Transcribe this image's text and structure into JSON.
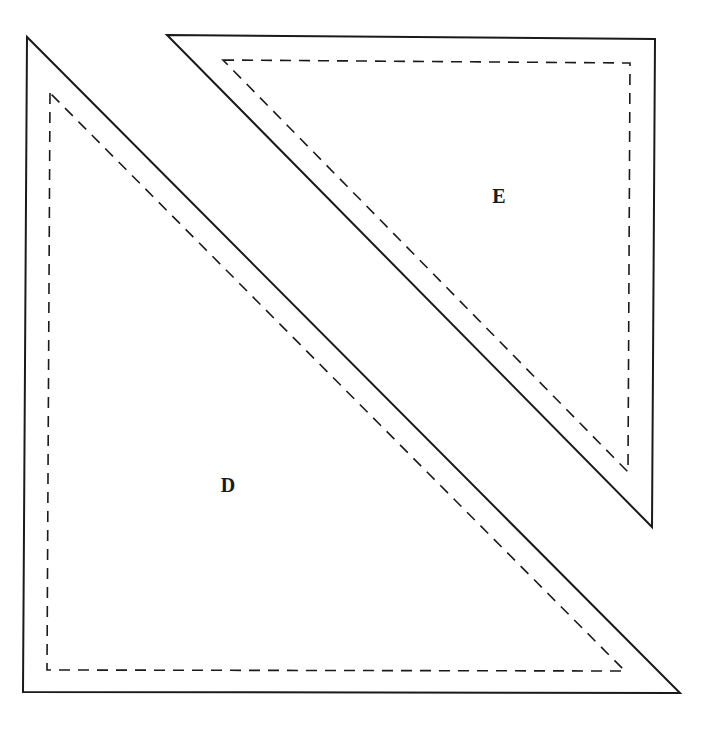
{
  "diagram": {
    "type": "quilt-pattern-template",
    "colors": {
      "line": "#1a1a1a",
      "background": "#ffffff"
    },
    "pieces": [
      {
        "id": "D",
        "label": "D",
        "shape": "right-triangle",
        "right_angle_corner": "bottom-left",
        "cut_line": [
          [
            27,
            37
          ],
          [
            23,
            692
          ],
          [
            680,
            693
          ]
        ],
        "seam_line": [
          [
            50,
            93
          ],
          [
            47,
            670
          ],
          [
            625,
            671
          ]
        ],
        "label_position": [
          228,
          492
        ]
      },
      {
        "id": "E",
        "label": "E",
        "shape": "right-triangle",
        "right_angle_corner": "top-right",
        "cut_line": [
          [
            167,
            35
          ],
          [
            655,
            39
          ],
          [
            652,
            527
          ]
        ],
        "seam_line": [
          [
            223,
            60
          ],
          [
            630,
            63
          ],
          [
            628,
            472
          ]
        ],
        "label_position": [
          499,
          203
        ]
      }
    ],
    "legend": {
      "solid_line": "cutting line",
      "dashed_line": "seam line"
    }
  }
}
